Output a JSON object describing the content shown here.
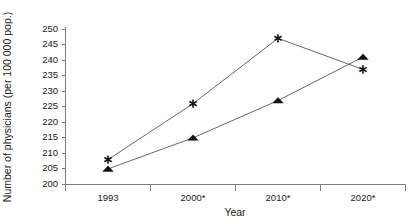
{
  "chart_data": {
    "type": "line",
    "title": "",
    "xlabel": "Year",
    "ylabel": "Number of physicians (per 100 000 pop.)",
    "categories": [
      "1993",
      "2000*",
      "2010*",
      "2020*"
    ],
    "series": [
      {
        "name": "star-series",
        "marker": "asterisk",
        "values": [
          208,
          226,
          247,
          237
        ]
      },
      {
        "name": "triangle-series",
        "marker": "triangle",
        "values": [
          205,
          215,
          227,
          241
        ]
      }
    ],
    "ylim": [
      200,
      250
    ],
    "yticks": [
      200,
      205,
      210,
      215,
      220,
      225,
      230,
      235,
      240,
      245,
      250
    ],
    "ytick_labels": [
      "200",
      "205",
      "210",
      "215",
      "220",
      "225",
      "230",
      "235",
      "240",
      "245",
      "250"
    ],
    "grid": false,
    "legend": "none"
  }
}
